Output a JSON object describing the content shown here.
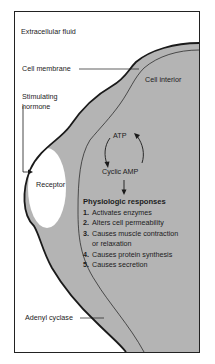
{
  "diagram": {
    "labels": {
      "extracellular_fluid": "Extracellular fluid",
      "cell_membrane": "Cell membrane",
      "cell_interior": "Cell interior",
      "stimulating_hormone_line1": "Stimulating",
      "stimulating_hormone_line2": "hormone",
      "receptor": "Receptor",
      "atp": "ATP",
      "cyclic_amp": "Cyclic AMP",
      "adenyl_cyclase": "Adenyl cyclase"
    },
    "physiologic_responses": {
      "title": "Physiologic responses",
      "items": [
        {
          "num": "1.",
          "text": "Activates enzymes"
        },
        {
          "num": "2.",
          "text": "Alters cell permeability"
        },
        {
          "num": "3.",
          "text": "Causes muscle contraction"
        },
        {
          "num": "",
          "text": "or relaxation"
        },
        {
          "num": "4.",
          "text": "Causes protein synthesis"
        },
        {
          "num": "5.",
          "text": "Causes secretion"
        }
      ]
    },
    "colors": {
      "cell_fill": "#b4b4b4",
      "background": "#ffffff",
      "outline": "#1a1a1a"
    }
  }
}
